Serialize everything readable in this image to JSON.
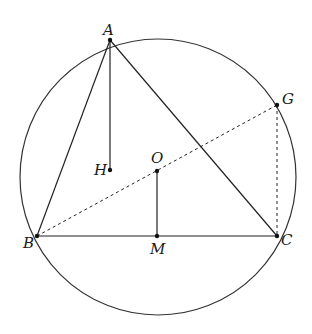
{
  "diagram": {
    "circle": {
      "center": "O",
      "cx": 158,
      "cy": 177,
      "r": 138
    },
    "points": {
      "A": {
        "label": "A",
        "x": 110,
        "y": 40
      },
      "B": {
        "label": "B",
        "x": 37,
        "y": 236
      },
      "C": {
        "label": "C",
        "x": 277,
        "y": 236
      },
      "G": {
        "label": "G",
        "x": 277,
        "y": 105
      },
      "H": {
        "label": "H",
        "x": 110,
        "y": 170
      },
      "O": {
        "label": "O",
        "x": 157,
        "y": 171
      },
      "M": {
        "label": "M",
        "x": 157,
        "y": 236
      }
    },
    "segments": [
      {
        "from": "A",
        "to": "B",
        "style": "solid"
      },
      {
        "from": "A",
        "to": "C",
        "style": "solid"
      },
      {
        "from": "B",
        "to": "C",
        "style": "solid"
      },
      {
        "from": "A",
        "to": "H",
        "style": "solid"
      },
      {
        "from": "O",
        "to": "M",
        "style": "solid"
      },
      {
        "from": "B",
        "to": "G",
        "style": "dashed"
      },
      {
        "from": "G",
        "to": "C",
        "style": "dashed"
      }
    ]
  }
}
